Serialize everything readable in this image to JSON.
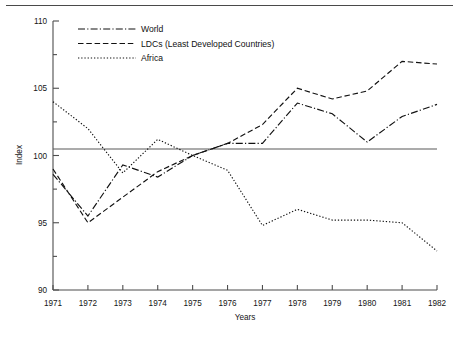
{
  "page": {
    "background": "#ffffff",
    "ink": "#111111",
    "rule_color": "#4a4a4a"
  },
  "chart_data": {
    "type": "line",
    "title": "",
    "xlabel": "Years",
    "ylabel": "Index",
    "x": [
      1971,
      1972,
      1973,
      1974,
      1975,
      1976,
      1977,
      1978,
      1979,
      1980,
      1981,
      1982
    ],
    "xtick_labels": [
      "1971",
      "1972",
      "1973",
      "1974",
      "1975",
      "1976",
      "1977",
      "1978",
      "1979",
      "1980",
      "1981",
      "1982"
    ],
    "ytick_labels": [
      "90",
      "95",
      "100",
      "105",
      "110"
    ],
    "yticks": [
      90,
      95,
      100,
      105,
      110
    ],
    "yminor_ticks": [
      92.5,
      97.5,
      102.5,
      107.5
    ],
    "ylim": [
      90,
      110
    ],
    "xlim": [
      1971,
      1982
    ],
    "grid": false,
    "reference_line": 100,
    "legend_position": "top-left",
    "series": [
      {
        "name": "World",
        "style": "dash-dot",
        "values": [
          98.6,
          95.5,
          99.3,
          98.4,
          100.0,
          100.9,
          100.9,
          103.9,
          103.1,
          101.0,
          102.9,
          103.8
        ]
      },
      {
        "name": "LDCs (Least Developed Countries)",
        "style": "dashed",
        "values": [
          99.0,
          95.0,
          96.9,
          98.8,
          100.0,
          100.9,
          102.3,
          105.0,
          104.2,
          104.8,
          107.0,
          106.8
        ]
      },
      {
        "name": "Africa",
        "style": "dotted",
        "values": [
          104.0,
          102.0,
          98.7,
          101.2,
          100.0,
          98.9,
          94.8,
          96.0,
          95.2,
          95.2,
          95.0,
          92.9
        ]
      }
    ]
  },
  "legend": {
    "items": [
      {
        "label": "World",
        "style": "dash-dot"
      },
      {
        "label": "LDCs (Least Developed Countries)",
        "style": "dashed"
      },
      {
        "label": "Africa",
        "style": "dotted"
      }
    ]
  },
  "axes": {
    "y_title": "Index",
    "x_title": "Years"
  }
}
